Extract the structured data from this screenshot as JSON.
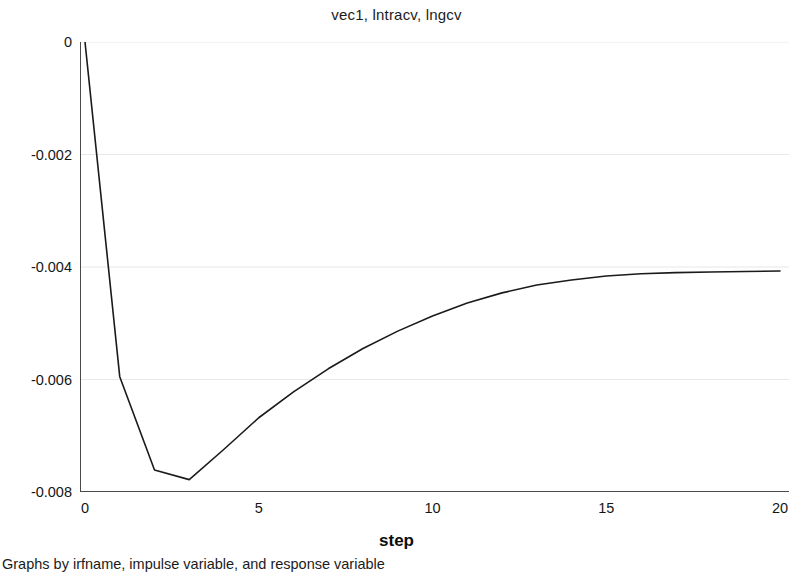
{
  "figure": {
    "title": "vec1, lntracv, lngcv",
    "note": "Graphs by irfname, impulse variable, and response variable",
    "background_color": "#ffffff",
    "grid_color": "#e8e8e8",
    "line_color": "#1a1a1a",
    "axis_color": "#444444"
  },
  "chart_data": {
    "type": "line",
    "title": "vec1, lntracv, lngcv",
    "subtitle": "",
    "xlabel": "step",
    "ylabel": "",
    "xlim": [
      0,
      20
    ],
    "ylim": [
      -0.008,
      0
    ],
    "xticks": [
      0,
      5,
      10,
      15,
      20
    ],
    "xtick_labels": [
      "0",
      "5",
      "10",
      "15",
      "20"
    ],
    "yticks": [
      0,
      -0.002,
      -0.004,
      -0.006,
      -0.008
    ],
    "ytick_labels": [
      "0",
      "-0.002",
      "-0.004",
      "-0.006",
      "-0.008"
    ],
    "grid": "horizontal",
    "legend": "none",
    "annotations": [
      "Graphs by irfname, impulse variable, and response variable"
    ],
    "series": [
      {
        "name": "vec1, lntracv, lngcv",
        "x": [
          0,
          1,
          2,
          3,
          4,
          5,
          6,
          7,
          8,
          9,
          10,
          11,
          12,
          13,
          14,
          15,
          16,
          17,
          18,
          19,
          20
        ],
        "values": [
          0,
          -0.00595,
          -0.00761,
          -0.00778,
          -0.00724,
          -0.00668,
          -0.00622,
          -0.00581,
          -0.00545,
          -0.00514,
          -0.00487,
          -0.00464,
          -0.00446,
          -0.00432,
          -0.00423,
          -0.00416,
          -0.00412,
          -0.0041,
          -0.00409,
          -0.00408,
          -0.00407
        ]
      }
    ]
  }
}
